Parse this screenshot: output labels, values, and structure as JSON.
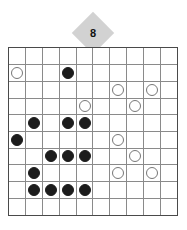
{
  "puzzle": {
    "title": "Grid puzzle board",
    "badge": {
      "icon": "diamond-badge",
      "value": "8"
    },
    "board": {
      "rows": 10,
      "cols": 10,
      "colors": {
        "black_stone": "#1c1c1c",
        "white_stone": "#ffffff",
        "white_stone_outline": "#777777",
        "grid_line": "#8a8a8a",
        "grid_border": "#4a4a4a",
        "badge_fill": "#d2d2d2",
        "background": "#ffffff"
      },
      "legend": {
        "empty": "",
        "black": "black-stone",
        "white": "white-stone"
      },
      "cells": [
        [
          "",
          "",
          "",
          "",
          "",
          "",
          "",
          "",
          "",
          ""
        ],
        [
          "white",
          "",
          "",
          "black",
          "",
          "",
          "",
          "",
          "",
          ""
        ],
        [
          "",
          "",
          "",
          "",
          "",
          "",
          "white",
          "",
          "white",
          ""
        ],
        [
          "",
          "",
          "",
          "",
          "white",
          "",
          "",
          "white",
          "",
          ""
        ],
        [
          "",
          "black",
          "",
          "black",
          "black",
          "",
          "",
          "",
          "",
          ""
        ],
        [
          "black",
          "",
          "",
          "",
          "",
          "",
          "white",
          "",
          "",
          ""
        ],
        [
          "",
          "",
          "black",
          "black",
          "black",
          "",
          "",
          "white",
          "",
          ""
        ],
        [
          "",
          "black",
          "",
          "",
          "",
          "",
          "white",
          "",
          "white",
          ""
        ],
        [
          "",
          "black",
          "black",
          "black",
          "black",
          "",
          "",
          "",
          "",
          ""
        ],
        [
          "",
          "",
          "",
          "",
          "",
          "",
          "",
          "",
          "",
          ""
        ]
      ]
    }
  }
}
